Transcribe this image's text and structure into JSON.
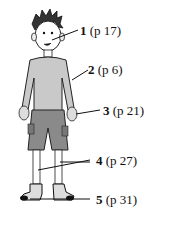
{
  "figure": {
    "labels": [
      {
        "num": "1",
        "ref": "(p 17)",
        "part": "ear"
      },
      {
        "num": "2",
        "ref": "(p 6)",
        "part": "arm"
      },
      {
        "num": "3",
        "ref": "(p 21)",
        "part": "hand"
      },
      {
        "num": "4",
        "ref": "(p 27)",
        "part": "legs"
      },
      {
        "num": "5",
        "ref": "(p 31)",
        "part": "feet"
      }
    ]
  }
}
